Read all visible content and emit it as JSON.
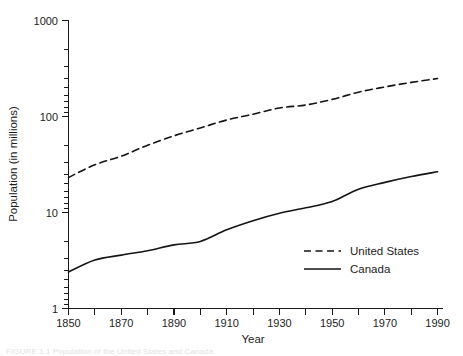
{
  "chart_data": {
    "type": "line",
    "title": "",
    "xlabel": "Year",
    "ylabel": "Population (in millions)",
    "yscale": "log",
    "ylim": [
      1,
      1000
    ],
    "xlim": [
      1850,
      1990
    ],
    "ytick_labels": [
      "1000",
      "100",
      "10",
      "1"
    ],
    "ytick_values": [
      1000,
      100,
      10,
      1
    ],
    "xtick_labels": [
      "1850",
      "1870",
      "1890",
      "1910",
      "1930",
      "1950",
      "1970",
      "1990"
    ],
    "xtick_values": [
      1850,
      1870,
      1890,
      1910,
      1930,
      1950,
      1970,
      1990
    ],
    "xtick_minor_values": [
      1860,
      1880,
      1900,
      1920,
      1940,
      1960,
      1980
    ],
    "grid": false,
    "legend_position": "center-right",
    "x": [
      1850,
      1860,
      1870,
      1880,
      1890,
      1900,
      1910,
      1920,
      1930,
      1940,
      1950,
      1960,
      1970,
      1980,
      1990
    ],
    "series": [
      {
        "name": "United States",
        "style": "dashed",
        "color": "#141414",
        "values": [
          23.2,
          31.4,
          38.6,
          50.2,
          62.9,
          76.0,
          92.0,
          105.7,
          122.8,
          131.7,
          150.7,
          179.3,
          203.2,
          226.5,
          248.7
        ]
      },
      {
        "name": "Canada",
        "style": "solid",
        "color": "#141414",
        "values": [
          2.4,
          3.2,
          3.6,
          4.0,
          4.6,
          5.0,
          6.6,
          8.2,
          9.8,
          11.2,
          13.0,
          17.5,
          20.6,
          23.7,
          26.6
        ]
      }
    ]
  },
  "legend": {
    "entries": [
      {
        "label": "United States",
        "style": "dashed"
      },
      {
        "label": "Canada",
        "style": "solid"
      }
    ]
  },
  "caption": {
    "text": "FIGURE 1.1  Population of the United States and Canada"
  },
  "colors": {
    "ink": "#141414",
    "axis": "#1a1a1a",
    "background": "#ffffff"
  }
}
